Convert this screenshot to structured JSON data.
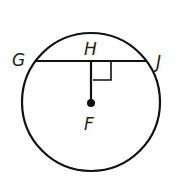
{
  "diagram": {
    "type": "circle-chord",
    "labels": {
      "G": "G",
      "H": "H",
      "J": "J",
      "F": "F"
    },
    "center_point": "F",
    "chord": "GJ",
    "perpendicular_segment": "HF",
    "right_angle_at": "H",
    "colors": {
      "stroke": "#111111",
      "background": "#ffffff"
    }
  }
}
